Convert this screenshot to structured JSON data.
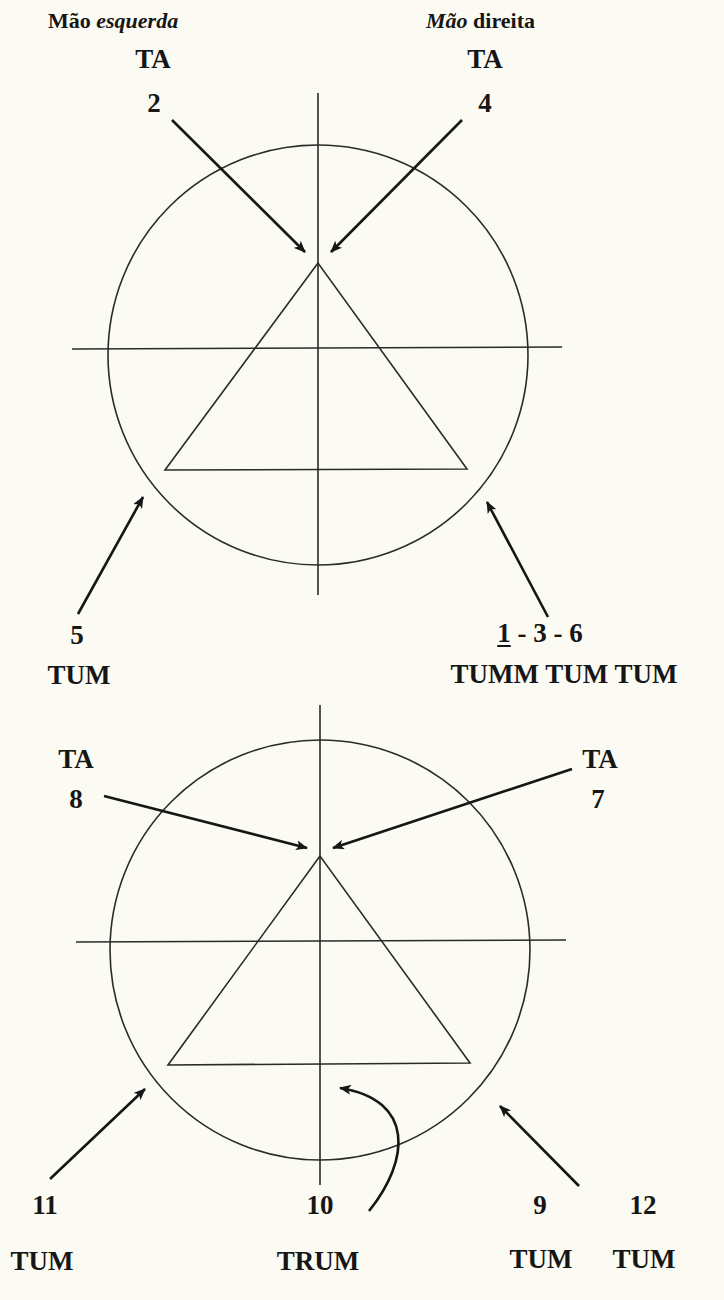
{
  "header": {
    "left_hand": {
      "word1": "Mão",
      "word2": "esquerda",
      "italic": "word2"
    },
    "right_hand": {
      "word1": "Mão",
      "word2": "direita",
      "italic": "word1"
    }
  },
  "diagram_top": {
    "labels": {
      "ta_left": "TA",
      "num_2": "2",
      "ta_right": "TA",
      "num_4": "4",
      "num_5": "5",
      "tum_left": "TUM",
      "num_1": "1",
      "num_rest": " - 3 - 6",
      "tumm": "TUMM TUM TUM"
    }
  },
  "diagram_bottom": {
    "labels": {
      "ta_left": "TA",
      "num_8": "8",
      "ta_right": "TA",
      "num_7": "7",
      "num_11": "11",
      "tum_11": "TUM",
      "num_10": "10",
      "trum": "TRUM",
      "num_9": "9",
      "tum_9": "TUM",
      "num_12": "12",
      "tum_12": "TUM"
    }
  },
  "colors": {
    "background": "#fbfbf3",
    "ink": "#161616",
    "line": "#2a2a2a"
  }
}
